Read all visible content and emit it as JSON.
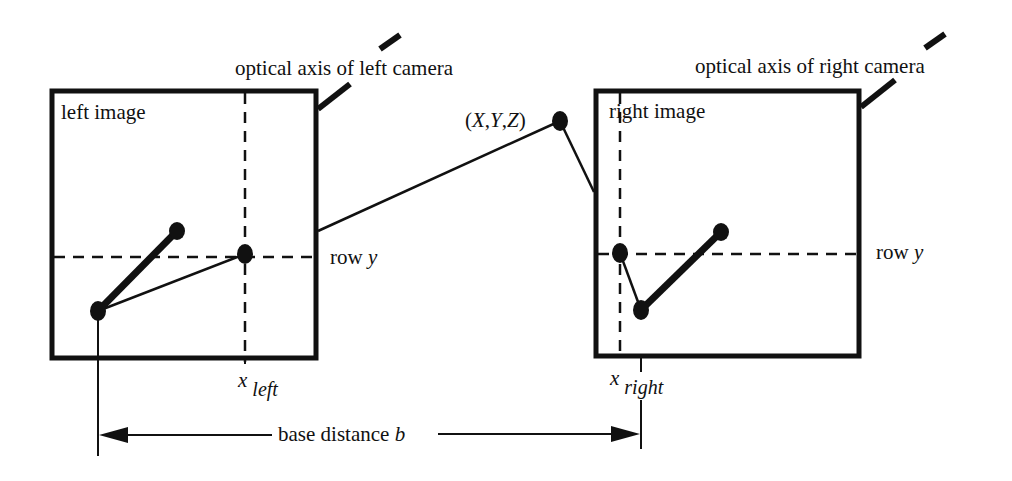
{
  "diagram": {
    "type": "stereo-vision-geometry",
    "left_image": {
      "label": "left image",
      "axis_label": "optical axis of left camera",
      "x_label": "x",
      "x_sub": "left",
      "row_label": "row ",
      "row_var": "y"
    },
    "right_image": {
      "label": "right image",
      "axis_label": "optical axis of right camera",
      "x_label": "x",
      "x_sub": "right",
      "row_label": "row ",
      "row_var": "y"
    },
    "world_point": {
      "label": "(X,Y,Z)"
    },
    "baseline": {
      "label": "base distance ",
      "var": "b"
    },
    "colors": {
      "stroke": "#111111",
      "background": "#ffffff"
    }
  }
}
